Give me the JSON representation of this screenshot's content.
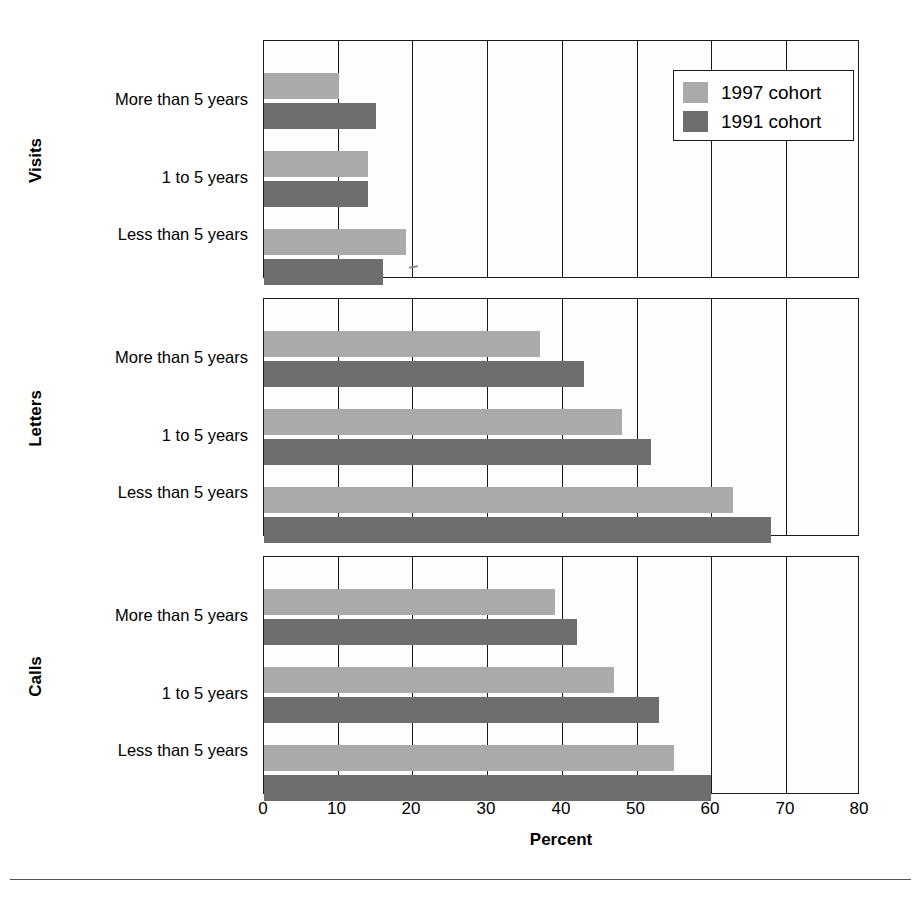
{
  "chart_data": {
    "type": "bar",
    "orientation": "horizontal",
    "title": "",
    "xlabel": "Percent",
    "ylabel": "",
    "xlim": [
      0,
      80
    ],
    "xticks": [
      "0",
      "10",
      "20",
      "30",
      "40",
      "50",
      "60",
      "70",
      "80"
    ],
    "grid": true,
    "legend_position": "top-right",
    "categories": [
      "Less than 5 years",
      "1 to 5 years",
      "More than 5 years"
    ],
    "series": [
      {
        "name": "1997 cohort",
        "color": "#aaaaaa"
      },
      {
        "name": "1991 cohort",
        "color": "#6e6e6e"
      }
    ],
    "panels": [
      {
        "group": "Visits",
        "categories": [
          "More than 5 years",
          "1 to 5 years",
          "Less than 5 years"
        ],
        "series": [
          {
            "name": "1997 cohort",
            "values": [
              10,
              14,
              19
            ]
          },
          {
            "name": "1991 cohort",
            "values": [
              15,
              14,
              16
            ]
          }
        ]
      },
      {
        "group": "Letters",
        "categories": [
          "More than 5 years",
          "1 to 5 years",
          "Less than 5 years"
        ],
        "series": [
          {
            "name": "1997 cohort",
            "values": [
              37,
              48,
              63
            ]
          },
          {
            "name": "1991 cohort",
            "values": [
              43,
              52,
              68
            ]
          }
        ]
      },
      {
        "group": "Calls",
        "categories": [
          "More than 5 years",
          "1 to 5 years",
          "Less than 5 years"
        ],
        "series": [
          {
            "name": "1997 cohort",
            "values": [
              39,
              47,
              55
            ]
          },
          {
            "name": "1991 cohort",
            "values": [
              42,
              53,
              60
            ]
          }
        ]
      }
    ]
  },
  "legend": {
    "items": [
      {
        "label": "1997 cohort",
        "swatch": "light"
      },
      {
        "label": "1991 cohort",
        "swatch": "dark"
      }
    ]
  },
  "axis": {
    "title": "Percent",
    "ticks": [
      "0",
      "10",
      "20",
      "30",
      "40",
      "50",
      "60",
      "70",
      "80"
    ]
  },
  "groups": [
    "Visits",
    "Letters",
    "Calls"
  ],
  "colors": {
    "light_bar": "#aaaaaa",
    "dark_bar": "#6e6e6e",
    "axis": "#1a1a1a",
    "background": "#ffffff"
  }
}
